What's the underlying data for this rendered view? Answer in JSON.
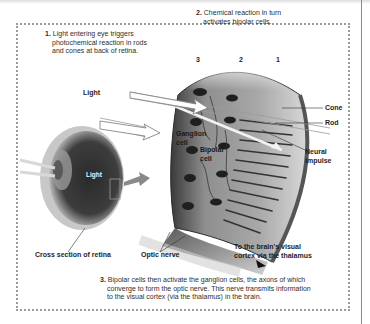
{
  "diagram": {
    "steps": [
      {
        "number": "1.",
        "lines": [
          "Light entering eye triggers",
          "photochemical reaction in rods",
          "and cones at back of retina."
        ]
      },
      {
        "number": "2.",
        "lines": [
          "Chemical reaction in turn",
          "activates bipolar cells."
        ]
      },
      {
        "number": "3.",
        "lines": [
          "Bipolar cells then activate the ganglion cells, the axons of which",
          "converge to form the optic nerve. This nerve transmits information",
          "to the visual cortex (via the thalamus) in the brain."
        ]
      }
    ],
    "layer_numbers": [
      "3",
      "2",
      "1"
    ],
    "labels": {
      "light_top": "Light",
      "light_eye": "Light",
      "ganglion_cell": [
        "Ganglion",
        "cell"
      ],
      "bipolar_cell": [
        "Bipolar",
        "cell"
      ],
      "cone": "Cone",
      "rod": "Rod",
      "neural_impulse": [
        "Neural",
        "impulse"
      ],
      "cross_section": "Cross section of retina",
      "optic_nerve": "Optic nerve",
      "to_brain": [
        "To the brain's visual",
        "cortex via the thalamus"
      ]
    },
    "colors": {
      "frame_dots": "#9a9a9a",
      "text": "#2a2a2a",
      "tissue_dark": "#2b2b2b",
      "tissue_mid": "#8f8f8f",
      "tissue_light": "#c9c9c9"
    }
  }
}
